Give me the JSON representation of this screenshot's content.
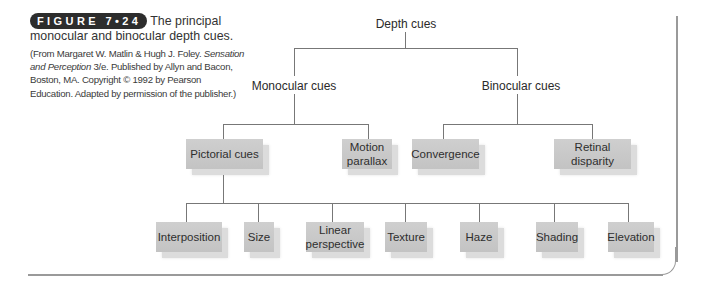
{
  "caption": {
    "figure_label": "FIGURE 7•24",
    "title": "The principal monocular and binocular depth cues.",
    "source_prefix": "(From Margaret W. Matlin & Hugh J. Foley. ",
    "source_book": "Sensation and Perception",
    "source_suffix": " 3/e. Published by Allyn and Bacon, Boston, MA. Copyright © 1992 by Pearson Education. Adapted by permission of the publisher.)"
  },
  "diagram": {
    "root": "Depth cues",
    "level1": {
      "monocular": "Monocular cues",
      "binocular": "Binocular cues"
    },
    "level2": {
      "pictorial": "Pictorial cues",
      "motion_parallax": "Motion parallax",
      "convergence": "Convergence",
      "retinal_disparity": "Retinal disparity"
    },
    "level3": {
      "interposition": "Interposition",
      "size": "Size",
      "linear_perspective": "Linear perspective",
      "texture": "Texture",
      "haze": "Haze",
      "shading": "Shading",
      "elevation": "Elevation"
    }
  },
  "colors": {
    "badge_bg": "#2d2d2d",
    "box_fill": "#c9c9c9",
    "box_shadow": "#dcdcdc",
    "connector": "#777777",
    "frame": "#9a9a9a"
  }
}
